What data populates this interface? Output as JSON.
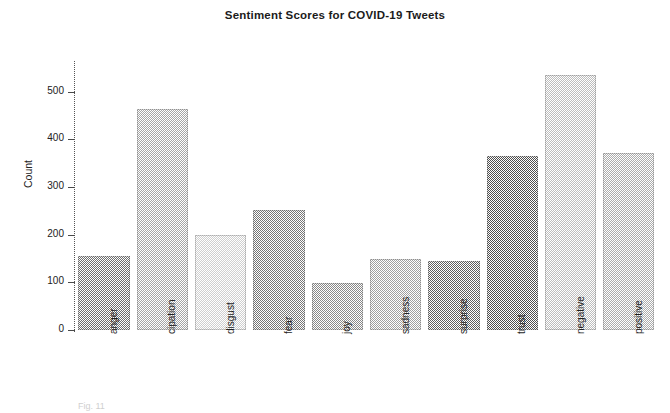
{
  "chart_data": {
    "type": "bar",
    "title": "Sentiment Scores for COVID-19 Tweets",
    "xlabel": "",
    "ylabel": "Count",
    "categories": [
      "anger",
      "cipation",
      "disgust",
      "fear",
      "joy",
      "sadness",
      "surprise",
      "trust",
      "negative",
      "positive"
    ],
    "values": [
      155,
      463,
      199,
      251,
      98,
      148,
      144,
      366,
      534,
      372
    ],
    "ylim": [
      0,
      560
    ],
    "yticks": [
      0,
      100,
      200,
      300,
      400,
      500
    ],
    "ytick_labels": [
      "0",
      "100",
      "200",
      "300",
      "400",
      "500"
    ],
    "grid": false,
    "legend": "none",
    "bar_colors": [
      "#6f6f6f",
      "#a6a6a6",
      "#cfcfcf",
      "#777777",
      "#8a8a8a",
      "#a0a0a0",
      "#5e5e5e",
      "#4f4f4f",
      "#bdbdbd",
      "#adadad"
    ]
  },
  "caption": {
    "text": "Fig. 11"
  }
}
